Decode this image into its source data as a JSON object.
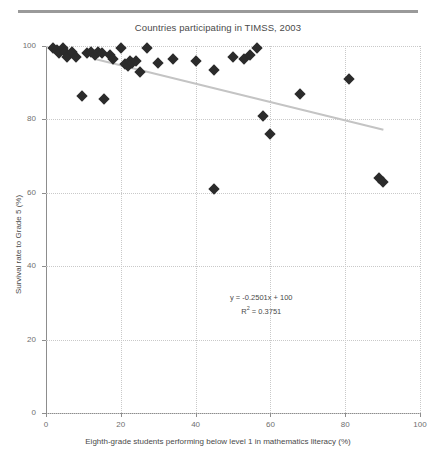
{
  "chart_data": {
    "type": "scatter",
    "title": "Countries participating in TIMSS, 2003",
    "xlabel": "Eighth-grade students performing below level 1 in mathematics literacy (%)",
    "ylabel": "Survival rate to Grade 5 (%)",
    "xlim": [
      0,
      100
    ],
    "ylim": [
      0,
      100
    ],
    "xticks": [
      0,
      20,
      40,
      60,
      80,
      100
    ],
    "yticks": [
      0,
      20,
      40,
      60,
      80,
      100
    ],
    "grid": true,
    "legend": "none",
    "marker": "diamond",
    "marker_color": "#2b2b2b",
    "points": [
      {
        "x": 2.0,
        "y": 99.5
      },
      {
        "x": 3.0,
        "y": 99.0
      },
      {
        "x": 3.5,
        "y": 98.0
      },
      {
        "x": 4.5,
        "y": 99.5
      },
      {
        "x": 5.0,
        "y": 98.5
      },
      {
        "x": 5.5,
        "y": 97.0
      },
      {
        "x": 7.0,
        "y": 98.5
      },
      {
        "x": 8.0,
        "y": 97.0
      },
      {
        "x": 9.5,
        "y": 86.5
      },
      {
        "x": 11.0,
        "y": 98.0
      },
      {
        "x": 12.0,
        "y": 98.5
      },
      {
        "x": 13.0,
        "y": 97.5
      },
      {
        "x": 14.0,
        "y": 98.5
      },
      {
        "x": 15.0,
        "y": 98.0
      },
      {
        "x": 15.5,
        "y": 85.5
      },
      {
        "x": 17.0,
        "y": 97.5
      },
      {
        "x": 18.0,
        "y": 96.5
      },
      {
        "x": 20.0,
        "y": 99.5
      },
      {
        "x": 21.0,
        "y": 95.0
      },
      {
        "x": 22.0,
        "y": 94.5
      },
      {
        "x": 22.5,
        "y": 96.0
      },
      {
        "x": 23.0,
        "y": 95.5
      },
      {
        "x": 24.0,
        "y": 96.0
      },
      {
        "x": 25.0,
        "y": 93.0
      },
      {
        "x": 27.0,
        "y": 99.5
      },
      {
        "x": 30.0,
        "y": 95.5
      },
      {
        "x": 34.0,
        "y": 96.5
      },
      {
        "x": 40.0,
        "y": 96.0
      },
      {
        "x": 45.0,
        "y": 93.5
      },
      {
        "x": 45.0,
        "y": 61.0
      },
      {
        "x": 50.0,
        "y": 97.0
      },
      {
        "x": 53.0,
        "y": 96.5
      },
      {
        "x": 54.5,
        "y": 97.5
      },
      {
        "x": 56.5,
        "y": 99.5
      },
      {
        "x": 58.0,
        "y": 81.0
      },
      {
        "x": 60.0,
        "y": 76.0
      },
      {
        "x": 68.0,
        "y": 87.0
      },
      {
        "x": 81.0,
        "y": 91.0
      },
      {
        "x": 89.0,
        "y": 64.0
      },
      {
        "x": 90.0,
        "y": 63.0
      }
    ],
    "trendline": {
      "equation": "y = -0.2501x + 100",
      "r_squared_label": "R",
      "r_squared_sup": "2",
      "r_squared_value": "= 0.3751",
      "slope": -0.2501,
      "intercept": 100,
      "x_start": 13,
      "x_end": 90,
      "color": "#c4c4c4"
    }
  },
  "axis": {
    "ytick_labels": [
      "0",
      "20",
      "40",
      "60",
      "80",
      "100"
    ],
    "xtick_labels": [
      "0",
      "20",
      "40",
      "60",
      "80",
      "100"
    ]
  }
}
